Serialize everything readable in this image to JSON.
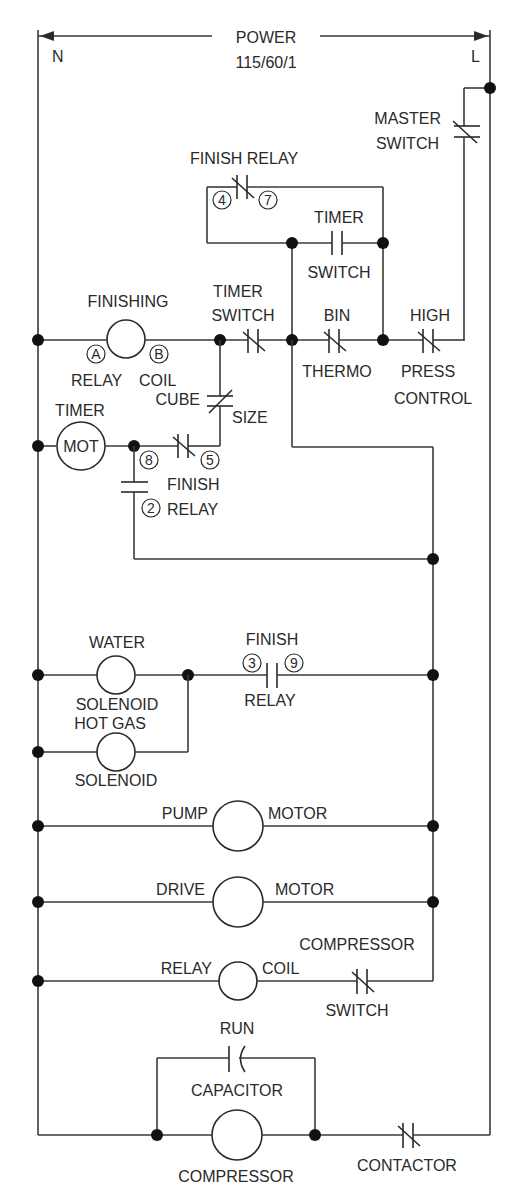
{
  "header": {
    "power_label": "POWER",
    "power_spec": "115/60/1",
    "neutral_label": "N",
    "line_label": "L"
  },
  "components": {
    "master_switch": {
      "line1": "MASTER",
      "line2": "SWITCH",
      "type": "normally-closed-contact"
    },
    "finish_relay_top": {
      "label": "FINISH RELAY",
      "terminal_a": "4",
      "terminal_b": "7",
      "type": "normally-closed-contact"
    },
    "timer_switch_no": {
      "line1": "TIMER",
      "line2": "SWITCH",
      "type": "normally-open-contact"
    },
    "finishing_relay_coil": {
      "line1": "FINISHING",
      "line2a": "RELAY",
      "line2b": "COIL",
      "terminal_a": "A",
      "terminal_b": "B",
      "type": "coil"
    },
    "timer_switch_nc": {
      "line1": "TIMER",
      "line2": "SWITCH",
      "type": "normally-closed-contact"
    },
    "bin_thermo": {
      "line1": "BIN",
      "line2": "THERMO",
      "type": "normally-closed-contact"
    },
    "high_press_control": {
      "line1": "HIGH",
      "line2": "PRESS",
      "line3": "CONTROL",
      "type": "normally-closed-contact"
    },
    "cube_size": {
      "line1": "CUBE",
      "line2": "SIZE",
      "type": "normally-closed-contact"
    },
    "timer_motor": {
      "label": "TIMER",
      "symbol": "MOT",
      "type": "motor"
    },
    "finish_relay_85": {
      "terminal_a": "8",
      "terminal_b": "5",
      "type": "normally-closed-contact"
    },
    "finish_relay_82": {
      "line1": "FINISH",
      "line2": "RELAY",
      "terminal_b": "2",
      "type": "normally-open-contact"
    },
    "water_solenoid": {
      "line1": "WATER",
      "line2": "SOLENOID",
      "type": "solenoid"
    },
    "hot_gas_solenoid": {
      "line1": "HOT GAS",
      "line2": "SOLENOID",
      "type": "solenoid"
    },
    "finish_relay_39": {
      "line1": "FINISH",
      "line2": "RELAY",
      "terminal_a": "3",
      "terminal_b": "9",
      "type": "normally-open-contact"
    },
    "pump_motor": {
      "left": "PUMP",
      "right": "MOTOR",
      "type": "motor"
    },
    "drive_motor": {
      "left": "DRIVE",
      "right": "MOTOR",
      "type": "motor"
    },
    "compressor_relay_coil": {
      "left": "RELAY",
      "right": "COIL",
      "type": "coil"
    },
    "compressor_switch": {
      "line1": "COMPRESSOR",
      "line2": "SWITCH",
      "type": "normally-closed-contact"
    },
    "run_capacitor": {
      "line1": "RUN",
      "line2": "CAPACITOR",
      "type": "capacitor"
    },
    "compressor": {
      "label": "COMPRESSOR",
      "type": "motor"
    },
    "contactor": {
      "label": "CONTACTOR",
      "type": "normally-closed-contact"
    }
  },
  "colors": {
    "wire": "#3a3a3a",
    "background": "#ffffff",
    "junction": "#111111"
  }
}
